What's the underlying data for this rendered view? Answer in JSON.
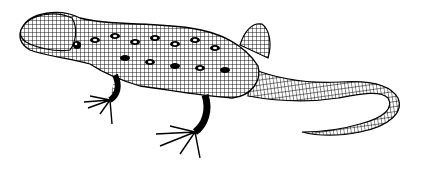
{
  "image": {
    "subject": "lizard line-art illustration",
    "style": "black ink engraving on white",
    "colors": {
      "ink": "#000000",
      "background": "#ffffff"
    }
  }
}
